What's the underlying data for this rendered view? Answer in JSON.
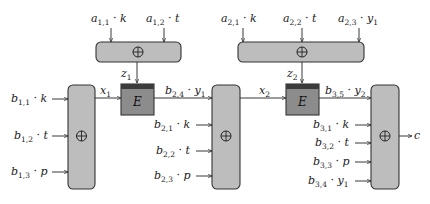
{
  "diagram": {
    "top_xor_1": {
      "inputs": [
        {
          "base": "a",
          "sub": "1,1",
          "var": "k",
          "varsub": ""
        },
        {
          "base": "a",
          "sub": "1,2",
          "var": "t",
          "varsub": ""
        }
      ],
      "symbol": "⊕",
      "output": {
        "base": "z",
        "sub": "1"
      }
    },
    "top_xor_2": {
      "inputs": [
        {
          "base": "a",
          "sub": "2,1",
          "var": "k",
          "varsub": ""
        },
        {
          "base": "a",
          "sub": "2,2",
          "var": "t",
          "varsub": ""
        },
        {
          "base": "a",
          "sub": "2,3",
          "var": "y",
          "varsub": "1"
        }
      ],
      "symbol": "⊕",
      "output": {
        "base": "z",
        "sub": "2"
      }
    },
    "xor_1": {
      "inputs": [
        {
          "base": "b",
          "sub": "1,1",
          "var": "k",
          "varsub": ""
        },
        {
          "base": "b",
          "sub": "1,2",
          "var": "t",
          "varsub": ""
        },
        {
          "base": "b",
          "sub": "1,3",
          "var": "p",
          "varsub": ""
        }
      ],
      "symbol": "⊕",
      "output": {
        "base": "x",
        "sub": "1"
      }
    },
    "cipher_1": {
      "label": "E",
      "output": {
        "base": "b",
        "sub": "2,4",
        "var": "y",
        "varsub": "1"
      }
    },
    "xor_2": {
      "inputs": [
        {
          "base": "b",
          "sub": "2,1",
          "var": "k",
          "varsub": ""
        },
        {
          "base": "b",
          "sub": "2,2",
          "var": "t",
          "varsub": ""
        },
        {
          "base": "b",
          "sub": "2,3",
          "var": "p",
          "varsub": ""
        }
      ],
      "symbol": "⊕",
      "output": {
        "base": "x",
        "sub": "2"
      }
    },
    "cipher_2": {
      "label": "E",
      "output": {
        "base": "b",
        "sub": "3,5",
        "var": "y",
        "varsub": "2"
      }
    },
    "xor_3": {
      "inputs": [
        {
          "base": "b",
          "sub": "3,1",
          "var": "k",
          "varsub": ""
        },
        {
          "base": "b",
          "sub": "3,2",
          "var": "t",
          "varsub": ""
        },
        {
          "base": "b",
          "sub": "3,3",
          "var": "p",
          "varsub": ""
        },
        {
          "base": "b",
          "sub": "3,4",
          "var": "y",
          "varsub": "1"
        }
      ],
      "symbol": "⊕",
      "output": {
        "base": "c",
        "sub": ""
      }
    }
  }
}
